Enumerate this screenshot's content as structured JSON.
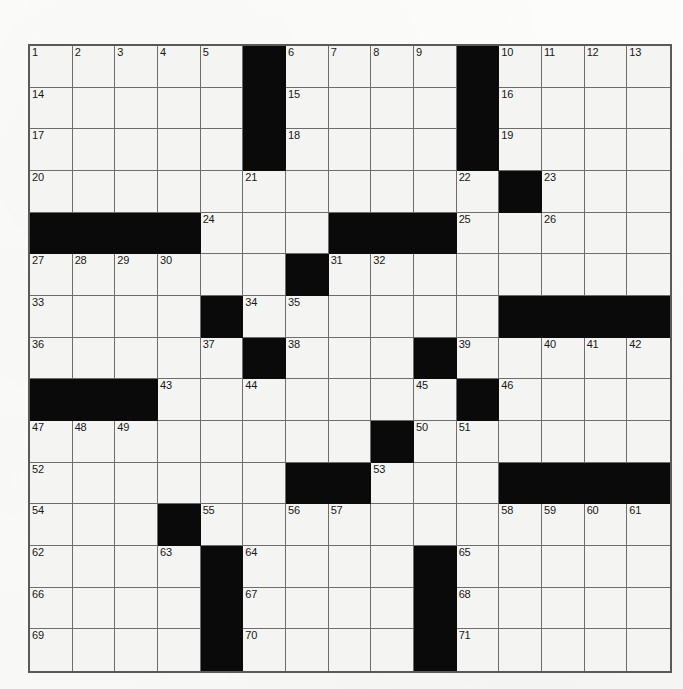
{
  "document": {
    "type": "crossword-puzzle-grid",
    "title": "Crossword Puzzle",
    "background_color": "#fbfbfa"
  },
  "grid": {
    "columns": 15,
    "rows": 15,
    "cell_color": "#f4f4f2",
    "block_color": "#0a0a0a",
    "line_color": "#6d6d6d",
    "border_color": "#5a5a5a",
    "number_color": "#181818",
    "total_clue_numbers": 71,
    "blocks": [
      [
        0,
        5
      ],
      [
        0,
        10
      ],
      [
        1,
        5
      ],
      [
        1,
        10
      ],
      [
        2,
        5
      ],
      [
        2,
        10
      ],
      [
        3,
        11
      ],
      [
        4,
        0
      ],
      [
        4,
        1
      ],
      [
        4,
        2
      ],
      [
        4,
        3
      ],
      [
        4,
        7
      ],
      [
        4,
        8
      ],
      [
        4,
        9
      ],
      [
        5,
        6
      ],
      [
        6,
        4
      ],
      [
        6,
        11
      ],
      [
        6,
        12
      ],
      [
        6,
        13
      ],
      [
        6,
        14
      ],
      [
        7,
        5
      ],
      [
        7,
        9
      ],
      [
        8,
        0
      ],
      [
        8,
        1
      ],
      [
        8,
        2
      ],
      [
        8,
        10
      ],
      [
        9,
        8
      ],
      [
        10,
        6
      ],
      [
        10,
        7
      ],
      [
        10,
        11
      ],
      [
        10,
        12
      ],
      [
        10,
        13
      ],
      [
        10,
        14
      ],
      [
        11,
        3
      ],
      [
        12,
        4
      ],
      [
        12,
        9
      ],
      [
        13,
        4
      ],
      [
        13,
        9
      ],
      [
        14,
        4
      ],
      [
        14,
        9
      ]
    ],
    "numbers": [
      {
        "n": 1,
        "row": 0,
        "col": 0
      },
      {
        "n": 2,
        "row": 0,
        "col": 1
      },
      {
        "n": 3,
        "row": 0,
        "col": 2
      },
      {
        "n": 4,
        "row": 0,
        "col": 3
      },
      {
        "n": 5,
        "row": 0,
        "col": 4
      },
      {
        "n": 6,
        "row": 0,
        "col": 6
      },
      {
        "n": 7,
        "row": 0,
        "col": 7
      },
      {
        "n": 8,
        "row": 0,
        "col": 8
      },
      {
        "n": 9,
        "row": 0,
        "col": 9
      },
      {
        "n": 10,
        "row": 0,
        "col": 11
      },
      {
        "n": 11,
        "row": 0,
        "col": 12
      },
      {
        "n": 12,
        "row": 0,
        "col": 13
      },
      {
        "n": 13,
        "row": 0,
        "col": 14
      },
      {
        "n": 14,
        "row": 1,
        "col": 0
      },
      {
        "n": 15,
        "row": 1,
        "col": 6
      },
      {
        "n": 16,
        "row": 1,
        "col": 11
      },
      {
        "n": 17,
        "row": 2,
        "col": 0
      },
      {
        "n": 18,
        "row": 2,
        "col": 6
      },
      {
        "n": 19,
        "row": 2,
        "col": 11
      },
      {
        "n": 20,
        "row": 3,
        "col": 0
      },
      {
        "n": 21,
        "row": 3,
        "col": 5
      },
      {
        "n": 22,
        "row": 3,
        "col": 10
      },
      {
        "n": 23,
        "row": 3,
        "col": 12
      },
      {
        "n": 24,
        "row": 4,
        "col": 4
      },
      {
        "n": 25,
        "row": 4,
        "col": 10
      },
      {
        "n": 26,
        "row": 4,
        "col": 12
      },
      {
        "n": 27,
        "row": 5,
        "col": 0
      },
      {
        "n": 28,
        "row": 5,
        "col": 1
      },
      {
        "n": 29,
        "row": 5,
        "col": 2
      },
      {
        "n": 30,
        "row": 5,
        "col": 3
      },
      {
        "n": 31,
        "row": 5,
        "col": 7
      },
      {
        "n": 32,
        "row": 5,
        "col": 8
      },
      {
        "n": 33,
        "row": 6,
        "col": 0
      },
      {
        "n": 34,
        "row": 6,
        "col": 5
      },
      {
        "n": 35,
        "row": 6,
        "col": 6
      },
      {
        "n": 36,
        "row": 7,
        "col": 0
      },
      {
        "n": 37,
        "row": 7,
        "col": 4
      },
      {
        "n": 38,
        "row": 7,
        "col": 6
      },
      {
        "n": 39,
        "row": 7,
        "col": 10
      },
      {
        "n": 40,
        "row": 7,
        "col": 12
      },
      {
        "n": 41,
        "row": 7,
        "col": 13
      },
      {
        "n": 42,
        "row": 7,
        "col": 14
      },
      {
        "n": 43,
        "row": 8,
        "col": 3
      },
      {
        "n": 44,
        "row": 8,
        "col": 5
      },
      {
        "n": 45,
        "row": 8,
        "col": 9
      },
      {
        "n": 46,
        "row": 8,
        "col": 11
      },
      {
        "n": 47,
        "row": 9,
        "col": 0
      },
      {
        "n": 48,
        "row": 9,
        "col": 1
      },
      {
        "n": 49,
        "row": 9,
        "col": 2
      },
      {
        "n": 50,
        "row": 9,
        "col": 9
      },
      {
        "n": 51,
        "row": 9,
        "col": 10
      },
      {
        "n": 52,
        "row": 10,
        "col": 0
      },
      {
        "n": 53,
        "row": 10,
        "col": 8
      },
      {
        "n": 54,
        "row": 11,
        "col": 0
      },
      {
        "n": 55,
        "row": 11,
        "col": 4
      },
      {
        "n": 56,
        "row": 11,
        "col": 6
      },
      {
        "n": 57,
        "row": 11,
        "col": 7
      },
      {
        "n": 58,
        "row": 11,
        "col": 11
      },
      {
        "n": 59,
        "row": 11,
        "col": 12
      },
      {
        "n": 60,
        "row": 11,
        "col": 13
      },
      {
        "n": 61,
        "row": 11,
        "col": 14
      },
      {
        "n": 62,
        "row": 12,
        "col": 0
      },
      {
        "n": 63,
        "row": 12,
        "col": 3
      },
      {
        "n": 64,
        "row": 12,
        "col": 5
      },
      {
        "n": 65,
        "row": 12,
        "col": 10
      },
      {
        "n": 66,
        "row": 13,
        "col": 0
      },
      {
        "n": 67,
        "row": 13,
        "col": 5
      },
      {
        "n": 68,
        "row": 13,
        "col": 10
      },
      {
        "n": 69,
        "row": 14,
        "col": 0
      },
      {
        "n": 70,
        "row": 14,
        "col": 5
      },
      {
        "n": 71,
        "row": 14,
        "col": 10
      }
    ]
  }
}
